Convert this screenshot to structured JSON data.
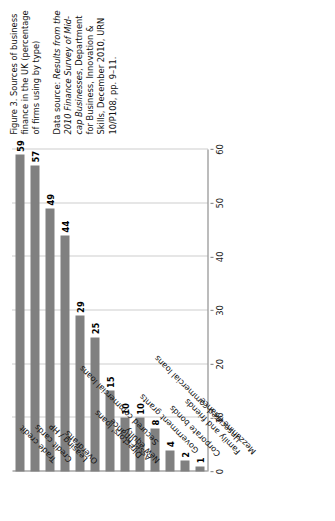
{
  "caption": {
    "title": "Figure 3. Sources of business finance in the UK (percentage of firms using by type)",
    "source_prefix": "Data source: ",
    "source_italic": "Results from the 2010 Finance Survey of Mid-cap Businesses",
    "source_rest": ", Department for Business, Innovation & Skills, December 2010, URN 10/P108, pp. 9–11."
  },
  "chart_data": {
    "type": "bar",
    "orientation": "horizontal",
    "title": "Figure 3. Sources of business finance in the UK (percentage of firms using by type)",
    "xlabel": "",
    "ylabel": "",
    "xlim": [
      0,
      60
    ],
    "grid": true,
    "legend": "none",
    "bar_color": "#808080",
    "axis_color": "#7a7a7a",
    "gridline_color": "#9a9a9a",
    "xticks": [
      0,
      10,
      20,
      30,
      40,
      50,
      60
    ],
    "categories": [
      "Trade credit",
      "Credit cards",
      "Leasing / HP",
      "Overdrafts",
      "Secured commercial loans",
      "Directors' loans",
      "Asset finance",
      "New equity",
      "Government grants",
      "Unsecured commercial loans",
      "Corporate bonds",
      "Family and friends",
      "Mezzanine finance"
    ],
    "values": [
      59,
      57,
      49,
      44,
      29,
      25,
      15,
      10,
      10,
      8,
      4,
      2,
      1
    ],
    "value_labels": [
      "59",
      "57",
      "49",
      "44",
      "29",
      "25",
      "15",
      "10",
      "10",
      "8",
      "4",
      "2",
      "1"
    ]
  }
}
